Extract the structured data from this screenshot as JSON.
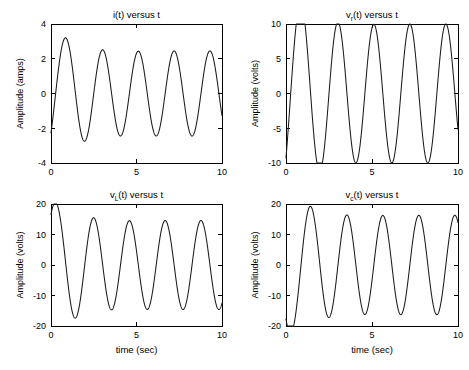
{
  "figure": {
    "width": 469,
    "height": 370,
    "background": "#ffffff",
    "curve_color": "#1a1a1a",
    "axis_color": "#000000"
  },
  "chart_data": [
    {
      "id": "current",
      "type": "line",
      "title": "i(t) versus t",
      "title_main": "i(t) versus t",
      "symbol": "i",
      "subscript": "",
      "xlabel": "",
      "ylabel": "Amplitude (amps)",
      "xlim": [
        0,
        10
      ],
      "ylim": [
        -4,
        4
      ],
      "xticks": [
        0,
        5,
        10
      ],
      "xticklabels": [
        "0",
        "5",
        "10"
      ],
      "yticks": [
        -4,
        -2,
        0,
        2,
        4
      ],
      "yticklabels": [
        "-4",
        "-2",
        "0",
        "2",
        "4"
      ],
      "grid": false,
      "legend": null,
      "model": {
        "description": "Series RLC current response: steady-state sinusoid plus decaying transient",
        "steady_amplitude": 2.45,
        "steady_omega": 3.0,
        "steady_phase": -1.18,
        "transient_amplitude": 1.95,
        "transient_omega": 2.3,
        "transient_phase": 0.0,
        "transient_decay": 0.95
      },
      "annotations": {
        "first_peak_t": 0.6,
        "first_peak_y": 1.0,
        "first_trough_t": 1.55,
        "first_trough_y": -1.9,
        "steady_peak_y": 2.45,
        "steady_trough_y": -2.45,
        "period": 2.09
      }
    },
    {
      "id": "resistor",
      "type": "line",
      "title": "vr(t) versus t",
      "title_main": "v",
      "subscript": "r",
      "title_tail": "(t) versus t",
      "xlabel": "",
      "ylabel": "Amplitude (volts)",
      "xlim": [
        0,
        10
      ],
      "ylim": [
        -10,
        10
      ],
      "xticks": [
        0,
        5,
        10
      ],
      "xticklabels": [
        "0",
        "5",
        "10"
      ],
      "yticks": [
        -10,
        -5,
        0,
        5,
        10
      ],
      "yticklabels": [
        "-10",
        "-5",
        "0",
        "5",
        "10"
      ],
      "grid": false,
      "legend": null,
      "model": {
        "description": "Resistor voltage = R times current, R = 4 ohms",
        "steady_amplitude": 10.0,
        "steady_omega": 3.0,
        "steady_phase": -1.18,
        "transient_amplitude": 7.8,
        "transient_omega": 2.3,
        "transient_phase": 0.0,
        "transient_decay": 0.95
      },
      "annotations": {
        "first_peak_t": 0.6,
        "first_peak_y": 3.9,
        "first_trough_t": 1.55,
        "first_trough_y": -7.6,
        "steady_peak_y": 10.0,
        "steady_trough_y": -9.7,
        "period": 2.09
      }
    },
    {
      "id": "inductor",
      "type": "line",
      "title": "vL(t) versus t",
      "title_main": "v",
      "subscript": "L",
      "title_tail": "(t) versus t",
      "xlabel": "time (sec)",
      "ylabel": "Amplitude (volts)",
      "xlim": [
        0,
        10
      ],
      "ylim": [
        -20,
        20
      ],
      "xticks": [
        0,
        5,
        10
      ],
      "xticklabels": [
        "0",
        "5",
        "10"
      ],
      "yticks": [
        -20,
        -10,
        0,
        10,
        20
      ],
      "yticklabels": [
        "-20",
        "-10",
        "0",
        "10",
        "20"
      ],
      "grid": false,
      "legend": null,
      "model": {
        "description": "Inductor voltage leads current by 90 degrees",
        "steady_amplitude": 14.6,
        "steady_omega": 3.0,
        "steady_phase": 0.39,
        "transient_amplitude": 11.0,
        "transient_omega": 2.3,
        "transient_phase": 1.571,
        "transient_decay": 0.95
      },
      "annotations": {
        "first_peak_t": 0.2,
        "first_peak_y": 4.8,
        "first_trough_t": 1.05,
        "first_trough_y": -9.8,
        "steady_peak_y": 14.6,
        "steady_trough_y": -14.4,
        "period": 2.09
      }
    },
    {
      "id": "capacitor",
      "type": "line",
      "title": "vc(t) versus t",
      "title_main": "v",
      "subscript": "c",
      "title_tail": "(t) versus t",
      "xlabel": "time (sec)",
      "ylabel": "Amplitude (volts)",
      "xlim": [
        0,
        10
      ],
      "ylim": [
        -20,
        20
      ],
      "xticks": [
        0,
        5,
        10
      ],
      "xticklabels": [
        "0",
        "5",
        "10"
      ],
      "yticks": [
        -20,
        -10,
        0,
        10,
        20
      ],
      "yticklabels": [
        "-20",
        "-10",
        "0",
        "10",
        "20"
      ],
      "grid": false,
      "legend": null,
      "model": {
        "description": "Capacitor voltage lags current by 90 degrees",
        "steady_amplitude": 16.3,
        "steady_omega": 3.0,
        "steady_phase": -2.75,
        "transient_amplitude": 11.5,
        "transient_omega": 2.3,
        "transient_phase": -1.571,
        "transient_decay": 0.95
      },
      "annotations": {
        "first_peak_t": 0.95,
        "first_peak_y": 10.7,
        "first_trough_t": 2.05,
        "first_trough_y": -14.1,
        "steady_peak_y": 16.3,
        "steady_trough_y": -16.4,
        "period": 2.09
      }
    }
  ],
  "layout": {
    "panels": [
      {
        "id": "current",
        "left": 0,
        "top": 0,
        "plot_x": 51,
        "plot_y": 24,
        "plot_w": 171,
        "plot_h": 139
      },
      {
        "id": "resistor",
        "left": 235,
        "top": 0,
        "plot_x": 51,
        "plot_y": 24,
        "plot_w": 172,
        "plot_h": 139
      },
      {
        "id": "inductor",
        "left": 0,
        "top": 183,
        "plot_x": 51,
        "plot_y": 21,
        "plot_w": 171,
        "plot_h": 122
      },
      {
        "id": "capacitor",
        "left": 235,
        "top": 183,
        "plot_x": 51,
        "plot_y": 21,
        "plot_w": 172,
        "plot_h": 122
      }
    ]
  }
}
